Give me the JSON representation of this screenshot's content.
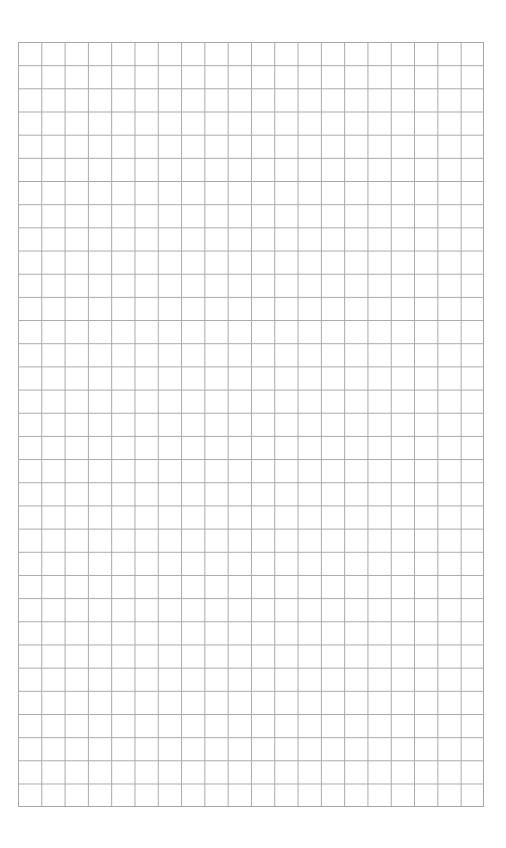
{
  "page": {
    "type": "graph-paper",
    "grid": {
      "columns": 20,
      "rows": 33,
      "line_color": "#a8a8a8",
      "background_color": "#ffffff"
    }
  }
}
